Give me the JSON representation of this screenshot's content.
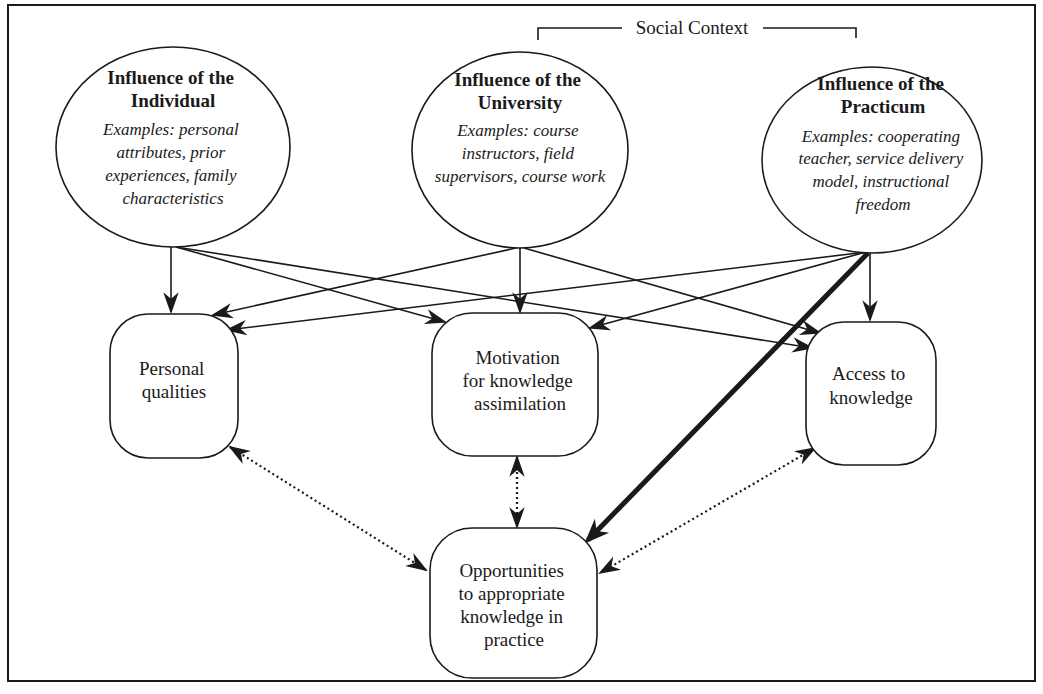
{
  "diagram": {
    "context_label": "Social Context",
    "influences": [
      {
        "id": "individual",
        "title_lines": [
          "Influence of the",
          "Individual"
        ],
        "example_lines": [
          "Examples: personal",
          "attributes, prior",
          "experiences, family",
          "characteristics"
        ]
      },
      {
        "id": "university",
        "title_lines": [
          "Influence of the",
          "University"
        ],
        "example_lines": [
          "Examples: course",
          "instructors, field",
          "supervisors, course work"
        ]
      },
      {
        "id": "practicum",
        "title_lines": [
          "Influence of the",
          "Practicum"
        ],
        "example_lines": [
          "Examples: cooperating",
          "teacher, service delivery",
          "model, instructional",
          "freedom"
        ]
      }
    ],
    "outcomes": [
      {
        "id": "personal-qualities",
        "lines": [
          "Personal",
          "qualities"
        ]
      },
      {
        "id": "motivation",
        "lines": [
          "Motivation",
          "for knowledge",
          "assimilation"
        ]
      },
      {
        "id": "access",
        "lines": [
          "Access to",
          "knowledge"
        ]
      }
    ],
    "final": {
      "id": "opportunities",
      "lines": [
        "Opportunities",
        "to appropriate",
        "knowledge in",
        "practice"
      ]
    },
    "edges": [
      {
        "from": "individual",
        "to": "personal-qualities",
        "style": "solid"
      },
      {
        "from": "individual",
        "to": "motivation",
        "style": "solid"
      },
      {
        "from": "individual",
        "to": "access",
        "style": "solid"
      },
      {
        "from": "university",
        "to": "personal-qualities",
        "style": "solid"
      },
      {
        "from": "university",
        "to": "motivation",
        "style": "solid"
      },
      {
        "from": "university",
        "to": "access",
        "style": "solid"
      },
      {
        "from": "practicum",
        "to": "personal-qualities",
        "style": "solid"
      },
      {
        "from": "practicum",
        "to": "motivation",
        "style": "solid"
      },
      {
        "from": "practicum",
        "to": "access",
        "style": "solid"
      },
      {
        "from": "practicum",
        "to": "opportunities",
        "style": "bold"
      },
      {
        "from": "personal-qualities",
        "to": "opportunities",
        "style": "dotted-bidirectional"
      },
      {
        "from": "motivation",
        "to": "opportunities",
        "style": "dotted-bidirectional"
      },
      {
        "from": "access",
        "to": "opportunities",
        "style": "dotted-bidirectional"
      }
    ]
  }
}
